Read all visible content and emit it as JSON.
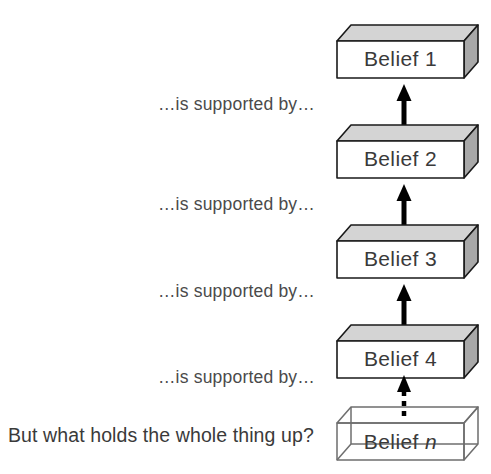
{
  "diagram": {
    "colors": {
      "background": "#ffffff",
      "front_face": "#ffffff",
      "top_face": "#d4d4d4",
      "side_face": "#a8a8a8",
      "edge_stroke": "#1a1a1a",
      "wireframe_stroke": "#6e6e6e",
      "text": "#3a3a3a",
      "arrow": "#000000"
    },
    "blocks": [
      {
        "id": "belief-1",
        "label": "Belief 1",
        "style": "solid",
        "italic_suffix": ""
      },
      {
        "id": "belief-2",
        "label": "Belief 2",
        "style": "solid",
        "italic_suffix": ""
      },
      {
        "id": "belief-3",
        "label": "Belief 3",
        "style": "solid",
        "italic_suffix": ""
      },
      {
        "id": "belief-4",
        "label": "Belief 4",
        "style": "solid",
        "italic_suffix": ""
      },
      {
        "id": "belief-n",
        "label": "Belief ",
        "style": "wireframe",
        "italic_suffix": "n"
      }
    ],
    "relations": [
      {
        "id": "relation-1",
        "label": "…is supported by…",
        "arrow": "solid"
      },
      {
        "id": "relation-2",
        "label": "…is supported by…",
        "arrow": "solid"
      },
      {
        "id": "relation-3",
        "label": "…is supported by…",
        "arrow": "solid"
      },
      {
        "id": "relation-4",
        "label": "…is supported by…",
        "arrow": "dashed"
      }
    ],
    "question": "But what holds the whole thing up?"
  }
}
